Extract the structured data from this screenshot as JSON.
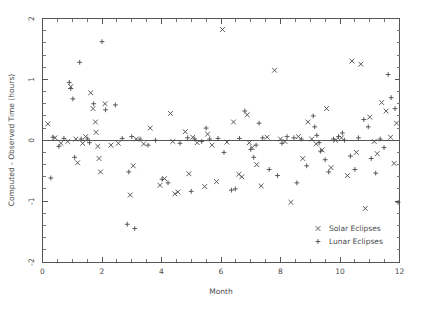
{
  "chart_data": {
    "type": "scatter",
    "title": "",
    "xlabel": "Month",
    "ylabel": "Computed - Observed Time (hours)",
    "xlim": [
      0,
      12
    ],
    "ylim": [
      -2,
      2
    ],
    "xticks": [
      0,
      2,
      4,
      6,
      8,
      10,
      12
    ],
    "yticks": [
      2,
      1,
      0,
      -1,
      -2
    ],
    "xtick_labels": [
      "0",
      "2",
      "4",
      "6",
      "8",
      "10",
      "12"
    ],
    "ytick_labels": [
      "2",
      "1",
      "0",
      "-1",
      "-2"
    ],
    "x_minor_step": 0.5,
    "y_minor_step": 0.2,
    "grid": false,
    "reference_line_y": 0,
    "legend_position": "bottom-right",
    "series": [
      {
        "name": "Solar Eclipses",
        "marker": "x",
        "color": "#4a4a4a",
        "points": [
          [
            0.18,
            0.27
          ],
          [
            0.42,
            0.04
          ],
          [
            0.62,
            -0.05
          ],
          [
            0.85,
            -0.02
          ],
          [
            1.12,
            0.02
          ],
          [
            1.18,
            -0.37
          ],
          [
            1.35,
            -0.05
          ],
          [
            1.45,
            0.06
          ],
          [
            1.62,
            0.78
          ],
          [
            1.7,
            0.52
          ],
          [
            1.78,
            0.3
          ],
          [
            1.8,
            0.13
          ],
          [
            1.86,
            -0.1
          ],
          [
            1.9,
            -0.3
          ],
          [
            1.95,
            -0.52
          ],
          [
            2.3,
            -0.08
          ],
          [
            2.55,
            -0.05
          ],
          [
            2.95,
            -0.9
          ],
          [
            3.15,
            0.02
          ],
          [
            3.4,
            -0.06
          ],
          [
            3.62,
            0.2
          ],
          [
            3.95,
            -0.74
          ],
          [
            4.1,
            -0.63
          ],
          [
            4.3,
            0.44
          ],
          [
            4.38,
            -0.02
          ],
          [
            4.45,
            -0.88
          ],
          [
            4.55,
            -0.85
          ],
          [
            4.8,
            0.14
          ],
          [
            5.05,
            0.05
          ],
          [
            5.2,
            -0.04
          ],
          [
            5.45,
            -0.76
          ],
          [
            5.55,
            0.1
          ],
          [
            5.7,
            -0.08
          ],
          [
            5.85,
            -0.68
          ],
          [
            6.05,
            1.82
          ],
          [
            6.2,
            -0.03
          ],
          [
            6.42,
            0.3
          ],
          [
            6.6,
            -0.56
          ],
          [
            6.7,
            -0.6
          ],
          [
            6.95,
            -0.04
          ],
          [
            7.05,
            -0.12
          ],
          [
            7.2,
            -0.4
          ],
          [
            7.35,
            -0.75
          ],
          [
            7.55,
            0.05
          ],
          [
            7.8,
            1.15
          ],
          [
            8.0,
            0.02
          ],
          [
            8.15,
            -0.02
          ],
          [
            8.35,
            -1.02
          ],
          [
            8.6,
            0.06
          ],
          [
            8.75,
            -0.3
          ],
          [
            9.05,
            0.02
          ],
          [
            9.2,
            -0.06
          ],
          [
            9.4,
            -0.16
          ],
          [
            9.55,
            0.52
          ],
          [
            9.7,
            -0.45
          ],
          [
            9.85,
            0.0
          ],
          [
            10.05,
            0.04
          ],
          [
            10.25,
            -0.58
          ],
          [
            10.4,
            1.3
          ],
          [
            10.55,
            -0.2
          ],
          [
            10.7,
            1.25
          ],
          [
            10.85,
            -1.12
          ],
          [
            11.0,
            0.38
          ],
          [
            11.15,
            -0.02
          ],
          [
            11.25,
            -0.22
          ],
          [
            11.4,
            0.62
          ],
          [
            11.55,
            0.48
          ],
          [
            11.7,
            0.05
          ],
          [
            11.82,
            -0.38
          ],
          [
            11.9,
            0.28
          ],
          [
            0.95,
            0.88
          ],
          [
            2.1,
            0.6
          ],
          [
            3.05,
            -0.42
          ],
          [
            4.92,
            -0.55
          ],
          [
            6.88,
            0.42
          ],
          [
            8.92,
            0.3
          ]
        ]
      },
      {
        "name": "Lunar Eclipses",
        "marker": "+",
        "color": "#4a4a4a",
        "points": [
          [
            0.35,
            0.05
          ],
          [
            0.55,
            -0.1
          ],
          [
            0.72,
            0.03
          ],
          [
            0.9,
            0.95
          ],
          [
            0.95,
            0.85
          ],
          [
            1.02,
            0.68
          ],
          [
            1.08,
            -0.28
          ],
          [
            1.25,
            1.28
          ],
          [
            1.3,
            0.02
          ],
          [
            1.52,
            0.02
          ],
          [
            1.58,
            -0.04
          ],
          [
            1.72,
            0.6
          ],
          [
            2.0,
            1.62
          ],
          [
            2.12,
            0.5
          ],
          [
            2.45,
            0.58
          ],
          [
            2.68,
            0.03
          ],
          [
            2.85,
            -1.38
          ],
          [
            3.0,
            0.06
          ],
          [
            3.28,
            0.02
          ],
          [
            3.55,
            -0.08
          ],
          [
            3.8,
            0.0
          ],
          [
            4.02,
            -0.64
          ],
          [
            4.22,
            -0.7
          ],
          [
            4.62,
            -0.05
          ],
          [
            4.88,
            0.04
          ],
          [
            5.0,
            -0.84
          ],
          [
            5.12,
            0.02
          ],
          [
            5.35,
            -0.02
          ],
          [
            5.62,
            0.02
          ],
          [
            5.9,
            0.03
          ],
          [
            6.1,
            -0.2
          ],
          [
            6.35,
            -0.82
          ],
          [
            6.48,
            -0.8
          ],
          [
            6.62,
            0.03
          ],
          [
            6.8,
            0.48
          ],
          [
            7.0,
            -0.15
          ],
          [
            7.1,
            -0.28
          ],
          [
            7.18,
            -0.08
          ],
          [
            7.28,
            0.28
          ],
          [
            7.4,
            0.04
          ],
          [
            7.62,
            -0.48
          ],
          [
            7.9,
            -0.58
          ],
          [
            8.05,
            -0.05
          ],
          [
            8.22,
            0.06
          ],
          [
            8.45,
            0.04
          ],
          [
            8.7,
            0.02
          ],
          [
            8.88,
            -0.42
          ],
          [
            9.1,
            0.4
          ],
          [
            9.15,
            0.22
          ],
          [
            9.22,
            0.08
          ],
          [
            9.3,
            -0.04
          ],
          [
            9.35,
            -0.18
          ],
          [
            9.5,
            -0.32
          ],
          [
            9.62,
            -0.52
          ],
          [
            9.78,
            0.02
          ],
          [
            9.95,
            0.06
          ],
          [
            10.15,
            0.0
          ],
          [
            10.35,
            -0.26
          ],
          [
            10.5,
            -0.48
          ],
          [
            10.62,
            0.04
          ],
          [
            10.8,
            0.34
          ],
          [
            10.95,
            0.22
          ],
          [
            11.05,
            -0.3
          ],
          [
            11.2,
            -0.54
          ],
          [
            11.35,
            0.02
          ],
          [
            11.48,
            -0.12
          ],
          [
            11.62,
            1.08
          ],
          [
            11.72,
            0.7
          ],
          [
            11.85,
            0.52
          ],
          [
            11.95,
            -1.02
          ],
          [
            0.28,
            -0.62
          ],
          [
            2.9,
            -0.52
          ],
          [
            3.1,
            -1.45
          ],
          [
            5.5,
            0.2
          ],
          [
            8.55,
            -0.7
          ],
          [
            10.08,
            0.12
          ]
        ]
      }
    ]
  },
  "axes": {
    "x_axis_title": "Month",
    "y_axis_title": "Computed - Observed Time (hours)"
  },
  "legend": {
    "entries": [
      {
        "label": "Solar Eclipses",
        "marker": "x"
      },
      {
        "label": "Lunar Eclipses",
        "marker": "+"
      }
    ]
  }
}
